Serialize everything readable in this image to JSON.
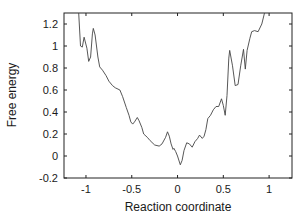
{
  "chart_data": {
    "type": "line",
    "title": "",
    "xlabel": "Reaction coordinate",
    "ylabel": "Free energy",
    "xlim": [
      -1.24,
      1.25
    ],
    "ylim": [
      -0.2,
      1.3
    ],
    "xticks": [
      -1,
      -0.5,
      0,
      0.5,
      1
    ],
    "xtick_labels": [
      "-1",
      "-0.5",
      "0",
      "0.5",
      "1"
    ],
    "yticks": [
      -0.2,
      0,
      0.2,
      0.4,
      0.6,
      0.8,
      1,
      1.2
    ],
    "ytick_labels": [
      "-0.2",
      "0",
      "0.2",
      "0.4",
      "0.6",
      "0.8",
      "1",
      "1.2"
    ],
    "grid": false,
    "legend": null,
    "series": [
      {
        "name": "free-energy-profile",
        "color": "#444444",
        "x": [
          -1.08,
          -1.06,
          -1.04,
          -1.02,
          -0.99,
          -0.97,
          -0.95,
          -0.93,
          -0.92,
          -0.9,
          -0.87,
          -0.85,
          -0.82,
          -0.78,
          -0.75,
          -0.71,
          -0.68,
          -0.63,
          -0.6,
          -0.56,
          -0.53,
          -0.51,
          -0.49,
          -0.47,
          -0.44,
          -0.42,
          -0.39,
          -0.37,
          -0.33,
          -0.3,
          -0.25,
          -0.2,
          -0.17,
          -0.13,
          -0.11,
          -0.09,
          -0.07,
          -0.05,
          -0.04,
          -0.02,
          0.0,
          0.03,
          0.05,
          0.07,
          0.1,
          0.13,
          0.16,
          0.19,
          0.22,
          0.24,
          0.27,
          0.29,
          0.31,
          0.33,
          0.36,
          0.39,
          0.42,
          0.45,
          0.48,
          0.5,
          0.52,
          0.54,
          0.56,
          0.57,
          0.6,
          0.63,
          0.66,
          0.69,
          0.72,
          0.74,
          0.76,
          0.79,
          0.81,
          0.84,
          0.88,
          0.92,
          0.95
        ],
        "y": [
          1.3,
          1.0,
          0.99,
          1.08,
          0.98,
          0.86,
          0.9,
          1.11,
          1.16,
          1.1,
          0.9,
          0.81,
          0.78,
          0.73,
          0.68,
          0.64,
          0.62,
          0.6,
          0.54,
          0.44,
          0.37,
          0.31,
          0.29,
          0.31,
          0.35,
          0.32,
          0.26,
          0.2,
          0.17,
          0.14,
          0.1,
          0.09,
          0.11,
          0.17,
          0.22,
          0.18,
          0.11,
          0.06,
          0.07,
          0.04,
          0.0,
          -0.08,
          -0.04,
          0.05,
          0.12,
          0.11,
          0.08,
          0.13,
          0.16,
          0.19,
          0.16,
          0.18,
          0.24,
          0.34,
          0.37,
          0.42,
          0.45,
          0.45,
          0.52,
          0.46,
          0.37,
          0.55,
          0.89,
          0.96,
          0.82,
          0.64,
          0.65,
          0.82,
          0.97,
          0.79,
          0.96,
          1.07,
          1.13,
          1.14,
          1.13,
          1.2,
          1.3
        ]
      }
    ]
  }
}
